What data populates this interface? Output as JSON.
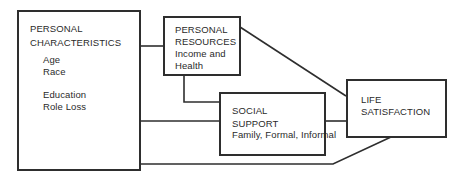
{
  "diagram": {
    "nodes": [
      {
        "id": "personal-characteristics",
        "title_lines": [
          "PERSONAL",
          "CHARACTERISTICS"
        ],
        "items": [
          "Age",
          "Race",
          "Education",
          "Role Loss"
        ]
      },
      {
        "id": "personal-resources",
        "title_lines": [
          "PERSONAL",
          "RESOURCES"
        ],
        "items": [
          "Income and",
          "Health"
        ]
      },
      {
        "id": "social-support",
        "title_lines": [
          "SOCIAL",
          "SUPPORT"
        ],
        "items": [
          "Family, Formal, Informal"
        ]
      },
      {
        "id": "life-satisfaction",
        "title_lines": [
          "LIFE",
          "SATISFACTION"
        ],
        "items": []
      }
    ],
    "edges": [
      {
        "from": "personal-characteristics",
        "to": "personal-resources"
      },
      {
        "from": "personal-characteristics",
        "to": "social-support"
      },
      {
        "from": "personal-characteristics",
        "to": "life-satisfaction"
      },
      {
        "from": "personal-resources",
        "to": "social-support"
      },
      {
        "from": "personal-resources",
        "to": "life-satisfaction"
      },
      {
        "from": "social-support",
        "to": "life-satisfaction"
      }
    ],
    "colors": {
      "line": "#2e2e2e",
      "text": "#2a2a2a",
      "background": "#ffffff"
    }
  }
}
